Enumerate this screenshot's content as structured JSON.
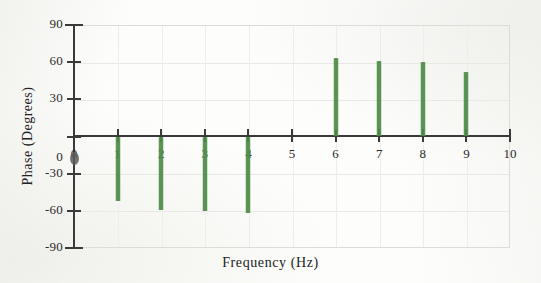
{
  "chart_data": {
    "type": "bar",
    "title": "",
    "subtitle": "",
    "xlabel": "Frequency (Hz)",
    "ylabel": "Phase (Degrees)",
    "xlim": [
      0,
      10
    ],
    "ylim": [
      -90,
      90
    ],
    "grid": true,
    "legend": null,
    "x_ticks": [
      0,
      1,
      2,
      3,
      4,
      5,
      6,
      7,
      8,
      9,
      10
    ],
    "x_tick_labels": [
      "0",
      "1",
      "2",
      "3",
      "4",
      "5",
      "6",
      "7",
      "8",
      "9",
      "10"
    ],
    "y_ticks": [
      90,
      60,
      30,
      0,
      -30,
      -60,
      -90
    ],
    "y_tick_labels": [
      "90",
      "60",
      "30",
      "0",
      "-30",
      "-60",
      "-90"
    ],
    "series": [
      {
        "name": "Phase",
        "style": "stem",
        "color": "#4e8c46",
        "x": [
          1,
          2,
          3,
          4,
          5,
          6,
          7,
          8,
          9
        ],
        "values": [
          -52,
          -59,
          -60,
          -62,
          0,
          63,
          61,
          60,
          52
        ]
      }
    ],
    "markers": [
      {
        "name": "origin-point",
        "x": 0,
        "y": -17,
        "color": "#5d5d5d"
      }
    ],
    "annotations": []
  },
  "axes": {
    "x_title": "Frequency (Hz)",
    "y_title": "Phase (Degrees)",
    "x_tick_labels": [
      "0",
      "1",
      "2",
      "3",
      "4",
      "5",
      "6",
      "7",
      "8",
      "9",
      "10"
    ],
    "y_tick_labels": [
      "90",
      "60",
      "30",
      "0",
      "-30",
      "-60",
      "-90"
    ]
  },
  "colors": {
    "stem": "#4e8c46",
    "axis": "#3a3a3a",
    "grid": "#e8e8e4",
    "frame": "#dcdcd8",
    "background": "#fdfdfb",
    "marker": "#5d5d5d"
  }
}
